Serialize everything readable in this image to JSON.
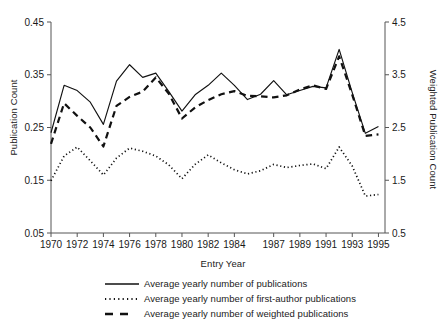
{
  "chart_data": {
    "type": "line",
    "title": "",
    "xlabel": "Entry Year",
    "ylabel": "Publication Count",
    "y2label": "Weighted Publication Count",
    "grid": false,
    "legend_position": "bottom",
    "xlim": [
      1970,
      1995.5
    ],
    "ylim": [
      0.05,
      0.45
    ],
    "y2lim": [
      0.5,
      4.5
    ],
    "yticks": [
      "0.45",
      "0.35",
      "0.25",
      "0.15",
      "0.05"
    ],
    "ytick_values": [
      0.45,
      0.35,
      0.25,
      0.15,
      0.05
    ],
    "y2ticks": [
      "4.5",
      "3.5",
      "2.5",
      "1.5",
      "0.5"
    ],
    "y2tick_values": [
      4.5,
      3.5,
      2.5,
      1.5,
      0.5
    ],
    "xticks": [
      "1970",
      "1972",
      "1974",
      "1976",
      "1978",
      "1980",
      "1982",
      "1984",
      "1987",
      "1989",
      "1991",
      "1993",
      "1995"
    ],
    "xtick_values": [
      1970,
      1972,
      1974,
      1976,
      1978,
      1980,
      1982,
      1984,
      1987,
      1989,
      1991,
      1993,
      1995
    ],
    "x": [
      1970,
      1971,
      1972,
      1973,
      1974,
      1975,
      1976,
      1977,
      1978,
      1979,
      1980,
      1981,
      1982,
      1983,
      1984,
      1985,
      1986,
      1987,
      1988,
      1989,
      1990,
      1991,
      1992,
      1993,
      1994,
      1995
    ],
    "series": [
      {
        "name": "Average yearly number of publications",
        "style": "solid",
        "axis": "left",
        "color": "#111111",
        "values": [
          0.24,
          0.33,
          0.32,
          0.298,
          0.256,
          0.338,
          0.369,
          0.345,
          0.353,
          0.318,
          0.281,
          0.312,
          0.33,
          0.353,
          0.33,
          0.303,
          0.313,
          0.339,
          0.312,
          0.32,
          0.328,
          0.325,
          0.398,
          0.316,
          0.239,
          0.252
        ]
      },
      {
        "name": "Average yearly number of first-author publications",
        "style": "dotted",
        "axis": "left",
        "color": "#111111",
        "values": [
          0.149,
          0.196,
          0.213,
          0.187,
          0.16,
          0.192,
          0.211,
          0.205,
          0.196,
          0.179,
          0.153,
          0.18,
          0.198,
          0.183,
          0.17,
          0.162,
          0.168,
          0.18,
          0.174,
          0.178,
          0.181,
          0.172,
          0.213,
          0.177,
          0.12,
          0.123
        ]
      },
      {
        "name": "Average yearly number of weighted publications",
        "style": "dashed",
        "axis": "left",
        "color": "#111111",
        "values": [
          0.219,
          0.296,
          0.272,
          0.25,
          0.214,
          0.291,
          0.308,
          0.318,
          0.345,
          0.314,
          0.267,
          0.288,
          0.302,
          0.313,
          0.319,
          0.31,
          0.309,
          0.307,
          0.311,
          0.322,
          0.33,
          0.323,
          0.385,
          0.312,
          0.234,
          0.237
        ]
      }
    ]
  },
  "legend": {
    "items": [
      {
        "label": "Average yearly number of publications",
        "style": "solid"
      },
      {
        "label": "Average yearly number of first-author publications",
        "style": "dotted"
      },
      {
        "label": "Average yearly number of weighted publications",
        "style": "dashed"
      }
    ]
  }
}
